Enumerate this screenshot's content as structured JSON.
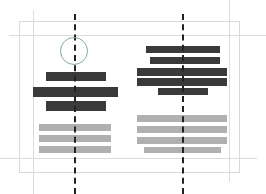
{
  "canvas": {
    "width": 266,
    "height": 194,
    "background": "#ffffff"
  },
  "frame": {
    "name": "page-frame",
    "x": 19,
    "y": 21,
    "width": 221,
    "height": 152,
    "stroke": "#d9d9d9"
  },
  "guides": {
    "stroke": "#dcdcdc",
    "vertical": [
      {
        "label": "left-margin-guide",
        "x": 33,
        "y": 10,
        "height": 184
      },
      {
        "label": "right-margin-guide",
        "x": 229,
        "y": 0,
        "height": 182
      }
    ],
    "horizontal": [
      {
        "label": "top-margin-guide",
        "y": 35,
        "x": 9,
        "width": 257
      },
      {
        "label": "bottom-margin-guide",
        "y": 158,
        "x": 0,
        "width": 257
      }
    ]
  },
  "dashed_lines": {
    "stroke": "#222222",
    "width": 2,
    "items": [
      {
        "label": "left-column-center-line",
        "x": 74,
        "y": 14,
        "height": 180
      },
      {
        "label": "right-column-center-line",
        "x": 182,
        "y": 14,
        "height": 180
      }
    ]
  },
  "annotation": {
    "label": "highlight-circle",
    "shape": "circle",
    "color": "#7fae93",
    "x": 60,
    "y": 37,
    "diameter": 28
  },
  "palette": {
    "dark_bar": "#3a3a3a",
    "light_bar": "#b0b0b0"
  },
  "columns": [
    {
      "name": "left-column",
      "bars": [
        {
          "tone": "dark",
          "x": 46,
          "y": 72,
          "width": 60,
          "height": 9
        },
        {
          "tone": "dark",
          "x": 33,
          "y": 87,
          "width": 85,
          "height": 10
        },
        {
          "tone": "dark",
          "x": 46,
          "y": 101,
          "width": 60,
          "height": 10
        },
        {
          "tone": "light",
          "x": 39,
          "y": 124,
          "width": 72,
          "height": 7
        },
        {
          "tone": "light",
          "x": 39,
          "y": 135,
          "width": 72,
          "height": 7
        },
        {
          "tone": "light",
          "x": 39,
          "y": 146,
          "width": 72,
          "height": 7
        }
      ]
    },
    {
      "name": "right-column",
      "bars": [
        {
          "tone": "dark",
          "x": 146,
          "y": 46,
          "width": 74,
          "height": 7
        },
        {
          "tone": "dark",
          "x": 150,
          "y": 57,
          "width": 70,
          "height": 7
        },
        {
          "tone": "dark",
          "x": 137,
          "y": 68,
          "width": 90,
          "height": 8
        },
        {
          "tone": "dark",
          "x": 137,
          "y": 78,
          "width": 90,
          "height": 8
        },
        {
          "tone": "dark",
          "x": 158,
          "y": 88,
          "width": 50,
          "height": 7
        },
        {
          "tone": "light",
          "x": 137,
          "y": 115,
          "width": 90,
          "height": 7
        },
        {
          "tone": "light",
          "x": 137,
          "y": 126,
          "width": 90,
          "height": 7
        },
        {
          "tone": "light",
          "x": 137,
          "y": 137,
          "width": 90,
          "height": 7
        },
        {
          "tone": "light",
          "x": 144,
          "y": 147,
          "width": 77,
          "height": 6
        }
      ]
    }
  ]
}
